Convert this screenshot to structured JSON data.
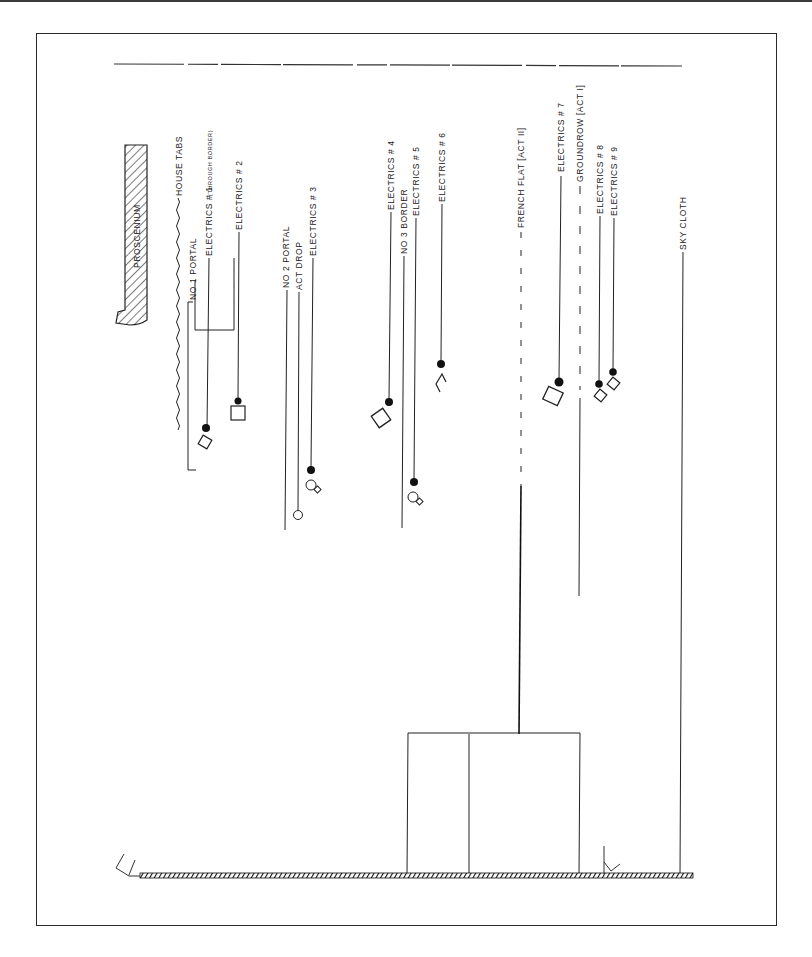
{
  "drawing": {
    "title": "Stage hanging section",
    "stroke_color": "#1a1a1a"
  },
  "labels": {
    "proscenium": "Proscenium",
    "house_tabs": "House Tabs",
    "no1_portal": "No 1 Portal",
    "electrics_1": "Electrics # 1",
    "electrics_1_note": "(Through Border)",
    "electrics_2": "Electrics # 2",
    "no2_portal": "No 2 Portal",
    "act_drop": "Act Drop",
    "electrics_3": "Electrics # 3",
    "electrics_4": "Electrics # 4",
    "no3_border": "No 3 Border",
    "electrics_5": "Electrics # 5",
    "electrics_6": "Electrics # 6",
    "french_flat": "French Flat [Act II]",
    "electrics_7": "Electrics # 7",
    "ground_row": "Groundrow [Act I]",
    "electrics_8": "Electrics # 8",
    "electrics_9": "Electrics # 9",
    "sky_cloth": "Sky Cloth"
  }
}
